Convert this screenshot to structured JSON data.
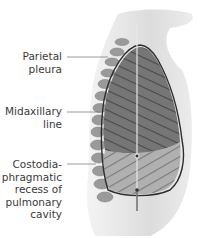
{
  "figure": {
    "labels": [
      {
        "id": "parietal-pleura",
        "text": "Parietal\npleura",
        "line_y": 57
      },
      {
        "id": "midaxillary-line",
        "text": "Midaxillary\nline",
        "line_y": 112
      },
      {
        "id": "costodiaphragmatic-recess",
        "text": "Costodia-\nphragmatic\nrecess of\npulmonary\ncavity",
        "line_y": 164
      }
    ],
    "colors": {
      "lung_fill": "#6e6e6e",
      "recess_fill": "#a8a8a8",
      "outline": "#2e2e2e",
      "body_shadow": "#d8d8d8",
      "leader_line": "#707070"
    }
  }
}
